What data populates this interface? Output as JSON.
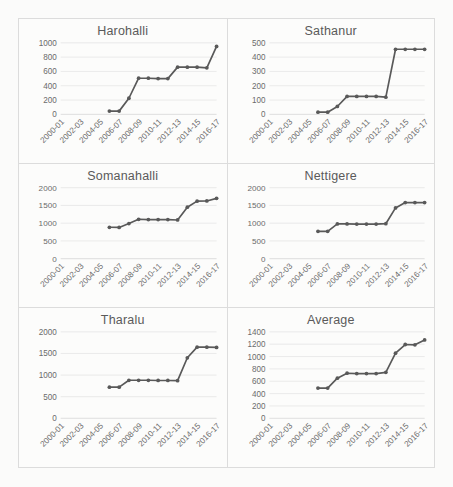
{
  "figure": {
    "background": "#fbfbfa",
    "series_color": "#595959",
    "grid_color": "#e2e2e2",
    "panel_border": "#dcdcdc"
  },
  "chart_data": [
    {
      "type": "line",
      "title": "Harohalli",
      "xlabel": "",
      "ylabel": "",
      "grid": true,
      "legend": "none",
      "ylim": [
        0,
        1000
      ],
      "yticks": [
        0,
        200,
        400,
        600,
        800,
        1000
      ],
      "categories": [
        "2000-01",
        "2001-02",
        "2002-03",
        "2003-04",
        "2004-05",
        "2005-06",
        "2006-07",
        "2007-08",
        "2008-09",
        "2009-10",
        "2010-11",
        "2011-12",
        "2012-13",
        "2013-14",
        "2014-15",
        "2015-16",
        "2016-17"
      ],
      "xtick_labels": [
        "2000-01",
        "2002-03",
        "2004-05",
        "2006-07",
        "2008-09",
        "2010-11",
        "2012-13",
        "2014-15",
        "2016-17"
      ],
      "x": [
        "2005-06",
        "2006-07",
        "2007-08",
        "2008-09",
        "2009-10",
        "2010-11",
        "2011-12",
        "2012-13",
        "2013-14",
        "2014-15",
        "2015-16",
        "2016-17"
      ],
      "values": [
        45,
        45,
        225,
        505,
        505,
        500,
        500,
        660,
        660,
        660,
        650,
        950
      ]
    },
    {
      "type": "line",
      "title": "Sathanur",
      "xlabel": "",
      "ylabel": "",
      "grid": true,
      "legend": "none",
      "ylim": [
        0,
        500
      ],
      "yticks": [
        0,
        100,
        200,
        300,
        400,
        500
      ],
      "categories": [
        "2000-01",
        "2001-02",
        "2002-03",
        "2003-04",
        "2004-05",
        "2005-06",
        "2006-07",
        "2007-08",
        "2008-09",
        "2009-10",
        "2010-11",
        "2011-12",
        "2012-13",
        "2013-14",
        "2014-15",
        "2015-16",
        "2016-17"
      ],
      "xtick_labels": [
        "2000-01",
        "2002-03",
        "2004-05",
        "2006-07",
        "2008-09",
        "2010-11",
        "2012-13",
        "2014-15",
        "2016-17"
      ],
      "x": [
        "2005-06",
        "2006-07",
        "2007-08",
        "2008-09",
        "2009-10",
        "2010-11",
        "2011-12",
        "2012-13",
        "2013-14",
        "2014-15",
        "2015-16",
        "2016-17"
      ],
      "values": [
        15,
        15,
        55,
        125,
        125,
        125,
        125,
        120,
        455,
        455,
        455,
        455
      ]
    },
    {
      "type": "line",
      "title": "Somanahalli",
      "xlabel": "",
      "ylabel": "",
      "grid": true,
      "legend": "none",
      "ylim": [
        0,
        2000
      ],
      "yticks": [
        0,
        500,
        1000,
        1500,
        2000
      ],
      "categories": [
        "2000-01",
        "2001-02",
        "2002-03",
        "2003-04",
        "2004-05",
        "2005-06",
        "2006-07",
        "2007-08",
        "2008-09",
        "2009-10",
        "2010-11",
        "2011-12",
        "2012-13",
        "2013-14",
        "2014-15",
        "2015-16",
        "2016-17"
      ],
      "xtick_labels": [
        "2000-01",
        "2002-03",
        "2004-05",
        "2006-07",
        "2008-09",
        "2010-11",
        "2012-13",
        "2014-15",
        "2016-17"
      ],
      "x": [
        "2005-06",
        "2006-07",
        "2007-08",
        "2008-09",
        "2009-10",
        "2010-11",
        "2011-12",
        "2012-13",
        "2013-14",
        "2014-15",
        "2015-16",
        "2016-17"
      ],
      "values": [
        885,
        880,
        990,
        1110,
        1100,
        1100,
        1100,
        1090,
        1450,
        1620,
        1625,
        1700
      ]
    },
    {
      "type": "line",
      "title": "Nettigere",
      "xlabel": "",
      "ylabel": "",
      "grid": true,
      "legend": "none",
      "ylim": [
        0,
        2000
      ],
      "yticks": [
        0,
        500,
        1000,
        1500,
        2000
      ],
      "categories": [
        "2000-01",
        "2001-02",
        "2002-03",
        "2003-04",
        "2004-05",
        "2005-06",
        "2006-07",
        "2007-08",
        "2008-09",
        "2009-10",
        "2010-11",
        "2011-12",
        "2012-13",
        "2013-14",
        "2014-15",
        "2015-16",
        "2016-17"
      ],
      "xtick_labels": [
        "2000-01",
        "2002-03",
        "2004-05",
        "2006-07",
        "2008-09",
        "2010-11",
        "2012-13",
        "2014-15",
        "2016-17"
      ],
      "x": [
        "2005-06",
        "2006-07",
        "2007-08",
        "2008-09",
        "2009-10",
        "2010-11",
        "2011-12",
        "2012-13",
        "2013-14",
        "2014-15",
        "2015-16",
        "2016-17"
      ],
      "values": [
        770,
        770,
        980,
        980,
        975,
        975,
        975,
        985,
        1430,
        1580,
        1580,
        1580
      ]
    },
    {
      "type": "line",
      "title": "Tharalu",
      "xlabel": "",
      "ylabel": "",
      "grid": true,
      "legend": "none",
      "ylim": [
        0,
        2000
      ],
      "yticks": [
        0,
        500,
        1000,
        1500,
        2000
      ],
      "categories": [
        "2000-01",
        "2001-02",
        "2002-03",
        "2003-04",
        "2004-05",
        "2005-06",
        "2006-07",
        "2007-08",
        "2008-09",
        "2009-10",
        "2010-11",
        "2011-12",
        "2012-13",
        "2013-14",
        "2014-15",
        "2015-16",
        "2016-17"
      ],
      "xtick_labels": [
        "2000-01",
        "2002-03",
        "2004-05",
        "2006-07",
        "2008-09",
        "2010-11",
        "2012-13",
        "2014-15",
        "2016-17"
      ],
      "x": [
        "2005-06",
        "2006-07",
        "2007-08",
        "2008-09",
        "2009-10",
        "2010-11",
        "2011-12",
        "2012-13",
        "2013-14",
        "2014-15",
        "2015-16",
        "2016-17"
      ],
      "values": [
        720,
        720,
        880,
        880,
        880,
        875,
        875,
        870,
        1400,
        1645,
        1645,
        1640
      ]
    },
    {
      "type": "line",
      "title": "Average",
      "xlabel": "",
      "ylabel": "",
      "grid": true,
      "legend": "none",
      "ylim": [
        0,
        1400
      ],
      "yticks": [
        0,
        200,
        400,
        600,
        800,
        1000,
        1200,
        1400
      ],
      "categories": [
        "2000-01",
        "2001-02",
        "2002-03",
        "2003-04",
        "2004-05",
        "2005-06",
        "2006-07",
        "2007-08",
        "2008-09",
        "2009-10",
        "2010-11",
        "2011-12",
        "2012-13",
        "2013-14",
        "2014-15",
        "2015-16",
        "2016-17"
      ],
      "xtick_labels": [
        "2000-01",
        "2002-03",
        "2004-05",
        "2006-07",
        "2008-09",
        "2010-11",
        "2012-13",
        "2014-15",
        "2016-17"
      ],
      "x": [
        "2005-06",
        "2006-07",
        "2007-08",
        "2008-09",
        "2009-10",
        "2010-11",
        "2011-12",
        "2012-13",
        "2013-14",
        "2014-15",
        "2015-16",
        "2016-17"
      ],
      "values": [
        490,
        490,
        650,
        730,
        725,
        725,
        725,
        745,
        1055,
        1195,
        1190,
        1270
      ]
    }
  ]
}
